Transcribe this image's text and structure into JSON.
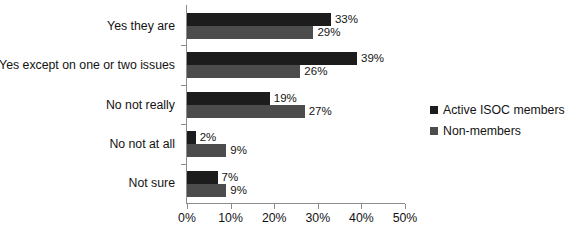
{
  "chart_data": {
    "type": "bar",
    "orientation": "horizontal",
    "title": "",
    "xlabel": "",
    "ylabel": "",
    "xlim": [
      0,
      50
    ],
    "xticks": [
      "0%",
      "10%",
      "20%",
      "30%",
      "40%",
      "50%"
    ],
    "xtick_values": [
      0,
      10,
      20,
      30,
      40,
      50
    ],
    "grid": false,
    "legend_position": "right",
    "value_suffix": "%",
    "categories": [
      "Yes they are",
      "Yes except on one or two issues",
      "No not really",
      "No not at all",
      "Not sure"
    ],
    "series": [
      {
        "name": "Active ISOC members",
        "color": "#1c1c1c",
        "values": [
          33,
          39,
          19,
          2,
          7
        ],
        "labels": [
          "33%",
          "39%",
          "19%",
          "2%",
          "7%"
        ]
      },
      {
        "name": "Non-members",
        "color": "#4c4c4c",
        "values": [
          29,
          26,
          27,
          9,
          9
        ],
        "labels": [
          "29%",
          "26%",
          "27%",
          "9%",
          "9%"
        ]
      }
    ]
  }
}
